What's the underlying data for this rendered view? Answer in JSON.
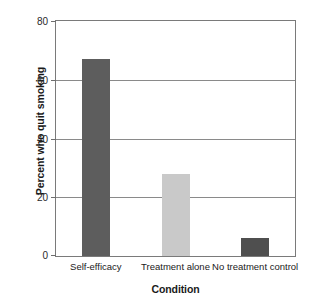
{
  "chart_data": {
    "type": "bar",
    "title": "",
    "subtitle": "",
    "xlabel": "Condition",
    "ylabel": "Percent who quit smoking",
    "categories": [
      "Self-efficacy",
      "Treatment alone",
      "No treatment control"
    ],
    "values": [
      67,
      28,
      6
    ],
    "series": [
      {
        "name": "Percent who quit smoking",
        "values": [
          67,
          28,
          6
        ]
      }
    ],
    "ylim": [
      0,
      80
    ],
    "yticks": [
      0,
      20,
      40,
      60,
      80
    ],
    "ytick_labels": [
      "0",
      "20",
      "40",
      "60",
      "80"
    ],
    "grid": true,
    "grid_axis": "y",
    "legend": false,
    "legend_position": "none",
    "bar_colors": [
      "#5d5d5d",
      "#c9c9c9",
      "#4f4f4f"
    ],
    "plot_background": "#ffffff",
    "axis_color": "#7a7a7a",
    "gridline_color": "#8a8a8a"
  },
  "axes": {
    "y_title": "Percent who quit smoking",
    "x_title": "Condition"
  }
}
